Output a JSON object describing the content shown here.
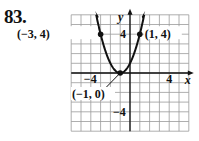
{
  "problem_number": "83.",
  "chart_data": {
    "type": "line",
    "title": "",
    "function": "y = (x + 1)^2",
    "xlabel": "x",
    "ylabel": "y",
    "xlim": [
      -6,
      6
    ],
    "ylim": [
      -6,
      6
    ],
    "grid": true,
    "x_tick_labels": [
      {
        "value": -4,
        "label": "−4"
      },
      {
        "value": 4,
        "label": "4"
      }
    ],
    "y_tick_labels": [
      {
        "value": 4,
        "label": "4"
      },
      {
        "value": -4,
        "label": "−4"
      }
    ],
    "points": [
      {
        "x": -3,
        "y": 4,
        "label": "(−3, 4)"
      },
      {
        "x": 1,
        "y": 4,
        "label": "(1, 4)"
      },
      {
        "x": -1,
        "y": 0,
        "label": "(−1, 0)"
      }
    ],
    "curve": {
      "x": [
        -3.4,
        -3,
        -2,
        -1,
        0,
        1,
        1.4
      ],
      "y": [
        5.76,
        4,
        1,
        0,
        1,
        4,
        5.76
      ]
    },
    "colors": {
      "curve": "#111111",
      "grid": "#9a9a9a",
      "axis": "#111111"
    }
  }
}
